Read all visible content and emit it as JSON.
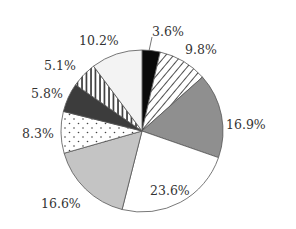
{
  "chart_data": {
    "type": "pie",
    "title": "",
    "start_angle_deg": 0,
    "direction": "clockwise",
    "slices": [
      {
        "label": "3.6%",
        "value": 3.6,
        "fill": "black"
      },
      {
        "label": "9.8%",
        "value": 9.8,
        "fill": "diagonal-hatch"
      },
      {
        "label": "16.9%",
        "value": 16.9,
        "fill": "dark-gray"
      },
      {
        "label": "23.6%",
        "value": 23.6,
        "fill": "white"
      },
      {
        "label": "16.6%",
        "value": 16.6,
        "fill": "light-gray"
      },
      {
        "label": "8.3%",
        "value": 8.3,
        "fill": "dots"
      },
      {
        "label": "5.8%",
        "value": 5.8,
        "fill": "charcoal"
      },
      {
        "label": "5.1%",
        "value": 5.1,
        "fill": "vertical-stripes"
      },
      {
        "label": "10.2%",
        "value": 10.2,
        "fill": "very-light-gray"
      }
    ],
    "values": [
      3.6,
      9.8,
      16.9,
      23.6,
      16.6,
      8.3,
      5.8,
      5.1,
      10.2
    ],
    "categories": [
      "3.6%",
      "9.8%",
      "16.9%",
      "23.6%",
      "16.6%",
      "8.3%",
      "5.8%",
      "5.1%",
      "10.2%"
    ],
    "legend": null
  },
  "labels": {
    "l0": "3.6%",
    "l1": "9.8%",
    "l2": "16.9%",
    "l3": "23.6%",
    "l4": "16.6%",
    "l5": "8.3%",
    "l6": "5.8%",
    "l7": "5.1%",
    "l8": "10.2%"
  },
  "colors": {
    "black": "#0a0a0a",
    "dark_gray": "#8f8f8f",
    "light_gray": "#c4c4c4",
    "charcoal": "#3c3c3c",
    "very_light_gray": "#f3f3f3",
    "white": "#ffffff",
    "stroke": "#555555"
  }
}
